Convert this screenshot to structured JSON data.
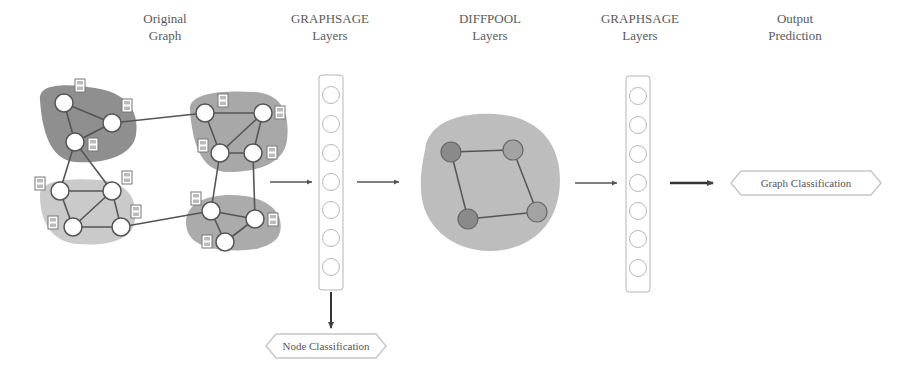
{
  "stages": [
    {
      "id": "original-graph",
      "line1": "Original",
      "line2": "Graph"
    },
    {
      "id": "graphsage-1",
      "line1": "GRAPHSAGE",
      "line2": "Layers"
    },
    {
      "id": "diffpool",
      "line1": "DIFFPOOL",
      "line2": "Layers"
    },
    {
      "id": "graphsage-2",
      "line1": "GRAPHSAGE",
      "line2": "Layers"
    },
    {
      "id": "output",
      "line1": "Output",
      "line2": "Prediction"
    }
  ],
  "outputs": {
    "node_classification": "Node Classification",
    "graph_classification": "Graph Classification"
  },
  "graphsage_layer_units": 7,
  "colors": {
    "cluster_dark": "#8f8f8f",
    "cluster_mid": "#a8a8a8",
    "cluster_light": "#c8c8c8",
    "edge": "#555555",
    "node_fill": "#ffffff",
    "pooled_node": "#8a8a8a",
    "arrow": "#444444",
    "layer_border": "#b5b5b5"
  }
}
